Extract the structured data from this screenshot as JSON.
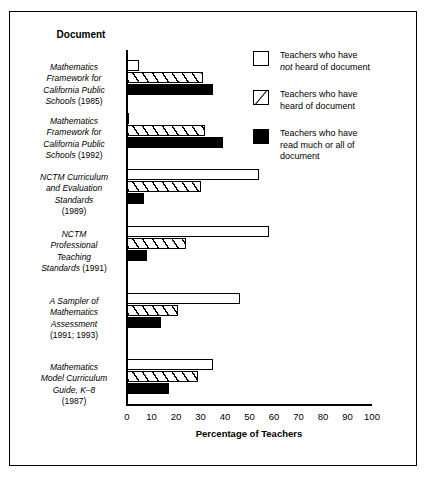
{
  "figure": {
    "column_header": "Document",
    "xlabel": "Percentage of Teachers"
  },
  "legend": {
    "position": "top-right",
    "items": [
      {
        "key": "not-heard",
        "swatch": "white",
        "line1": "Teachers who have",
        "emphasis": "not",
        "line2rest": " heard of document",
        "line3": ""
      },
      {
        "key": "heard",
        "swatch": "hatch",
        "line1": "Teachers who have",
        "emphasis": "",
        "line2rest": "heard of document",
        "line3": ""
      },
      {
        "key": "read-much-or-all",
        "swatch": "black",
        "line1": "Teachers who have",
        "emphasis": "",
        "line2rest": "read much or all of",
        "line3": "document"
      }
    ]
  },
  "axis": {
    "ticks": [
      0,
      10,
      20,
      30,
      40,
      50,
      60,
      70,
      80,
      90,
      100
    ],
    "min": 0,
    "max": 100
  },
  "chart_data": {
    "type": "bar",
    "orientation": "horizontal",
    "title": "",
    "xlabel": "Percentage of Teachers",
    "ylabel": "Document",
    "xlim": [
      0,
      100
    ],
    "grid": false,
    "legend_position": "top-right",
    "categories": [
      "Mathematics Framework for California Public Schools (1985)",
      "Mathematics Framework for California Public Schools (1992)",
      "NCTM Curriculum and Evaluation Standards (1989)",
      "NCTM Professional Teaching Standards (1991)",
      "A Sampler of Mathematics Assessment (1991; 1993)",
      "Mathematics Model Curriculum Guide, K–8 (1987)"
    ],
    "category_lines": [
      [
        "Mathematics",
        "Framework for",
        "California Public",
        "Schools (1985)"
      ],
      [
        "Mathematics",
        "Framework for",
        "California Public",
        "Schools (1992)"
      ],
      [
        "NCTM Curriculum",
        "and Evaluation",
        "Standards",
        "(1989)"
      ],
      [
        "NCTM",
        "Professional",
        "Teaching",
        "Standards (1991)"
      ],
      [
        "A Sampler of",
        "Mathematics",
        "Assessment",
        "(1991; 1993)"
      ],
      [
        "Mathematics",
        "Model Curriculum",
        "Guide, K–8",
        "(1987)"
      ]
    ],
    "series": [
      {
        "name": "Teachers who have not heard of document",
        "fill": "white",
        "values": [
          5,
          1,
          54,
          58,
          46,
          35
        ]
      },
      {
        "name": "Teachers who have heard of document",
        "fill": "hatch",
        "values": [
          31,
          32,
          30,
          24,
          21,
          29
        ]
      },
      {
        "name": "Teachers who have read much or all of document",
        "fill": "black",
        "values": [
          35,
          39,
          7,
          8,
          14,
          17
        ]
      }
    ]
  }
}
